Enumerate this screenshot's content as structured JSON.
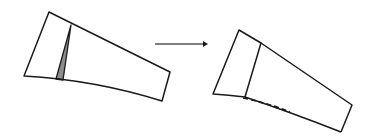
{
  "diagram": {
    "colors": {
      "stroke": "#1a1a1a",
      "wedge_fill": "#8c8c8c",
      "arrow": "#555555",
      "background": "#ffffff"
    },
    "before_shape": {
      "label": "",
      "outline": [
        [
          49,
          12
        ],
        [
          170,
          72
        ],
        [
          162,
          101
        ],
        [
          24,
          76
        ]
      ],
      "wedge": [
        [
          71,
          25
        ],
        [
          56,
          79
        ],
        [
          63,
          80
        ]
      ]
    },
    "arrow": {
      "from": [
        155,
        44
      ],
      "to": [
        207,
        44
      ],
      "label": ""
    },
    "after_shape": {
      "label": "",
      "outline": [
        [
          239,
          30
        ],
        [
          352,
          105
        ],
        [
          341,
          132
        ],
        [
          213,
          94
        ]
      ],
      "divider": [
        [
          261,
          43
        ],
        [
          245,
          97
        ]
      ],
      "dashed_edge": [
        [
          245,
          97
        ],
        [
          341,
          132
        ]
      ]
    }
  }
}
